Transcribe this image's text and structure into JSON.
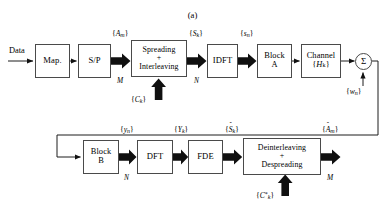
{
  "figure": {
    "caption": "(a)"
  },
  "transmitter": {
    "input_label": "Data",
    "blocks": [
      {
        "id": "map",
        "label": "Map."
      },
      {
        "id": "sp",
        "label": "S/P"
      },
      {
        "id": "spreading",
        "line1": "Spreading",
        "line2": "+",
        "line3": "Interleaving"
      },
      {
        "id": "idft",
        "label": "IDFT"
      },
      {
        "id": "block_a",
        "line1": "Block",
        "line2": "A"
      },
      {
        "id": "channel",
        "line1": "Channel",
        "line2": "{H",
        "sub2": "k",
        "line2b": "}"
      }
    ],
    "signals": [
      {
        "id": "a_m",
        "open": "{",
        "sym": "A",
        "sub": "m",
        "close": "}",
        "count": "M"
      },
      {
        "id": "s_k",
        "open": "{",
        "sym": "S",
        "sub": "k",
        "close": "}",
        "count": "N"
      },
      {
        "id": "s_n",
        "open": "{",
        "sym": "s",
        "sub": "n",
        "close": "}",
        "count": ""
      }
    ],
    "code_input": {
      "open": "{",
      "sym": "C",
      "sub": "k",
      "close": "}"
    },
    "channel_label": {
      "open": "{",
      "sym": "H",
      "sub": "k",
      "close": "}"
    },
    "adder": {
      "symbol": "Σ"
    },
    "noise": {
      "open": "{",
      "sym": "w",
      "sub": "n",
      "close": "}"
    }
  },
  "receiver": {
    "blocks": [
      {
        "id": "block_b",
        "line1": "Block",
        "line2": "B"
      },
      {
        "id": "dft",
        "label": "DFT"
      },
      {
        "id": "fde",
        "label": "FDE"
      },
      {
        "id": "deinter",
        "line1": "Deinterleaving",
        "line2": "+",
        "line3": "Despreading"
      }
    ],
    "signals": [
      {
        "id": "y_n",
        "open": "{",
        "sym": "y",
        "sub": "n",
        "close": "}",
        "count": "N",
        "mark": ""
      },
      {
        "id": "Y_k",
        "open": "{",
        "sym": "Y",
        "sub": "k",
        "close": "}",
        "count": "",
        "mark": ""
      },
      {
        "id": "S_k_h",
        "open": "{",
        "sym": "S",
        "sub": "k",
        "close": "}",
        "count": "",
        "mark": "ˆ"
      },
      {
        "id": "A_m_h",
        "open": "{",
        "sym": "A",
        "sub": "m",
        "close": "}",
        "count": "M",
        "mark": "ˆ"
      }
    ],
    "code_input": {
      "open": "{",
      "sym": "C",
      "sub": "k",
      "close": "}",
      "star": "*"
    }
  },
  "colors": {
    "line": "#4a4a4a",
    "arrow_thick": "#111111",
    "background": "#ffffff",
    "text": "#000000"
  }
}
